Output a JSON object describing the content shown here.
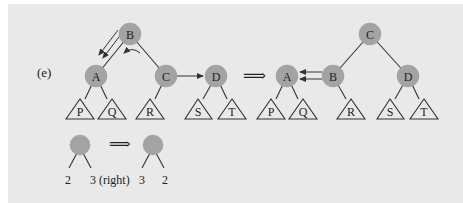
{
  "figure": {
    "label": "(e)",
    "background_color": "#e9e9e9",
    "node_color": "#a3a3a3",
    "transform_symbol": "⟹"
  },
  "before_tree": {
    "nodes": [
      {
        "id": "B",
        "label": "B",
        "x": 130,
        "y": 34
      },
      {
        "id": "A",
        "label": "A",
        "x": 96,
        "y": 76
      },
      {
        "id": "C",
        "label": "C",
        "x": 166,
        "y": 76
      },
      {
        "id": "D",
        "label": "D",
        "x": 216,
        "y": 76
      }
    ],
    "subtrees": [
      {
        "label": "P",
        "x": 80
      },
      {
        "label": "Q",
        "x": 112
      },
      {
        "label": "R",
        "x": 150
      },
      {
        "label": "S",
        "x": 198
      },
      {
        "label": "T",
        "x": 232
      }
    ]
  },
  "after_tree": {
    "nodes": [
      {
        "id": "C",
        "label": "C",
        "x": 370,
        "y": 34
      },
      {
        "id": "A",
        "label": "A",
        "x": 287,
        "y": 76
      },
      {
        "id": "B",
        "label": "B",
        "x": 333,
        "y": 76
      },
      {
        "id": "D",
        "label": "D",
        "x": 408,
        "y": 76
      }
    ],
    "subtrees": [
      {
        "label": "P",
        "x": 271
      },
      {
        "label": "Q",
        "x": 303
      },
      {
        "label": "R",
        "x": 351
      },
      {
        "label": "S",
        "x": 390
      },
      {
        "label": "T",
        "x": 424
      }
    ]
  },
  "legend": {
    "before_left": "2",
    "before_right": "3 (right)",
    "after_left": "3",
    "after_right": "2"
  }
}
